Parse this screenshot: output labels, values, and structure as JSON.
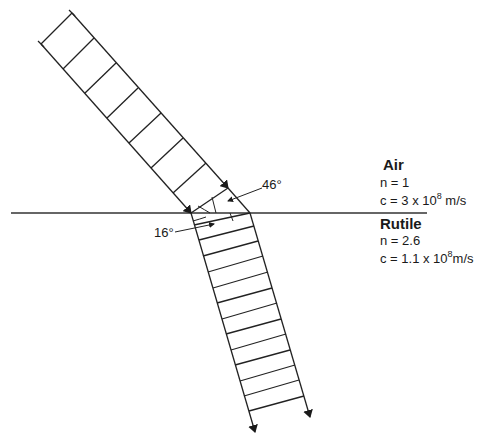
{
  "diagram": {
    "type": "refraction-wavefront-diagram",
    "interface_line": {
      "x1": 11,
      "y1": 213,
      "x2": 427,
      "y2": 213
    },
    "media": [
      {
        "name": "Air",
        "n_label": "n = 1",
        "c_label_prefix": "c = 3 x 10",
        "c_label_exp": "8",
        "c_label_suffix": " m/s"
      },
      {
        "name": "Rutile",
        "n_label": "n = 2.6",
        "c_label_prefix": "c = 1.1 x 10",
        "c_label_exp": "8",
        "c_label_suffix": "m/s"
      }
    ],
    "angles": {
      "incident": "46°",
      "refracted": "16°"
    },
    "incident_beam": {
      "wavefront_count": 7,
      "color": "#222222"
    },
    "refracted_beam": {
      "wavefront_count": 13,
      "color": "#222222"
    }
  }
}
